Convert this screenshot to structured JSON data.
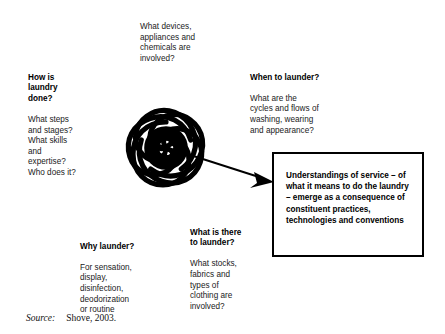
{
  "figure": {
    "source_label": "Source:",
    "source_value": "Shove, 2003."
  },
  "blocks": {
    "devices": {
      "heading": "",
      "body": "What devices,\nappliances and\nchemicals are\ninvolved?"
    },
    "how": {
      "heading": "How is\nlaundry\ndone?",
      "body": "What steps\nand stages?\nWhat skills\nand\nexpertise?\nWho does it?"
    },
    "when": {
      "heading": "When to launder?",
      "body": "What are the\ncycles and flows of\nwashing, wearing\nand appearance?"
    },
    "why": {
      "heading": "Why launder?",
      "body": "For sensation,\ndisplay,\ndisinfection,\ndeodorization\nor routine"
    },
    "what": {
      "heading": "What is there\nto launder?",
      "body": "What stocks,\nfabrics and\ntypes of\nclothing are\ninvolved?"
    }
  },
  "callout": {
    "text": "Understandings of service – of what it means to do the laundry – emerge as a consequence of constituent practices, technologies and conventions"
  },
  "icons": {
    "motif": "five-spirals-around-circle-icon",
    "arrow": "arrow-to-callout-icon"
  },
  "colors": {
    "ink": "#000000",
    "text": "#1a1a1a",
    "background": "#ffffff"
  }
}
